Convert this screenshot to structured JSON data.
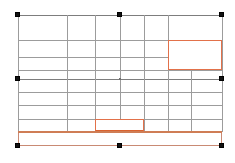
{
  "document": {
    "title": "Table object selection",
    "canvas_background": "#ffffff"
  },
  "selection": {
    "label": "Selected table frame",
    "handle_name": "selection-handle",
    "bounds": {
      "x": 18,
      "y": 15,
      "width": 204,
      "height": 131
    },
    "handles": [
      {
        "name": "handle-top-left",
        "x": 18,
        "y": 15
      },
      {
        "name": "handle-top-center",
        "x": 120,
        "y": 15
      },
      {
        "name": "handle-top-right",
        "x": 222,
        "y": 15
      },
      {
        "name": "handle-middle-left",
        "x": 18,
        "y": 79
      },
      {
        "name": "handle-middle-right",
        "x": 222,
        "y": 79
      },
      {
        "name": "handle-bottom-left",
        "x": 18,
        "y": 146
      },
      {
        "name": "handle-bottom-center",
        "x": 120,
        "y": 146
      },
      {
        "name": "handle-bottom-right",
        "x": 222,
        "y": 146
      }
    ],
    "center_marker": {
      "name": "rotation-center-dot",
      "x": 120,
      "y": 79
    }
  },
  "grid": {
    "accent_color": "#e2714a",
    "line_color": "#9c9c9c",
    "columns_x": [
      0,
      49,
      77,
      102,
      126,
      150,
      204
    ],
    "rows_y": [
      0,
      25,
      42,
      55,
      64,
      77,
      90,
      104,
      117,
      131
    ],
    "horizontal_lines": [
      {
        "name": "grid-row-line-1",
        "y": 0,
        "weight": "strong"
      },
      {
        "name": "grid-row-line-2",
        "y": 25,
        "weight": "normal"
      },
      {
        "name": "grid-row-line-3",
        "y": 42,
        "weight": "normal"
      },
      {
        "name": "grid-row-line-4",
        "y": 55,
        "weight": "normal"
      },
      {
        "name": "grid-row-line-5",
        "y": 64,
        "weight": "strong"
      },
      {
        "name": "grid-row-line-6",
        "y": 77,
        "weight": "normal"
      },
      {
        "name": "grid-row-line-7",
        "y": 90,
        "weight": "normal"
      },
      {
        "name": "grid-row-line-8",
        "y": 104,
        "weight": "normal"
      }
    ],
    "vertical_lines": [
      {
        "name": "grid-col-line-1",
        "x": 0,
        "top": 0,
        "height": 117
      },
      {
        "name": "grid-col-line-2",
        "x": 49,
        "top": 0,
        "height": 117
      },
      {
        "name": "grid-col-line-3",
        "x": 77,
        "top": 0,
        "height": 117
      },
      {
        "name": "grid-col-line-4",
        "x": 102,
        "top": 0,
        "height": 117
      },
      {
        "name": "grid-col-line-5",
        "x": 126,
        "top": 0,
        "height": 117
      },
      {
        "name": "grid-col-line-6",
        "x": 150,
        "top": 0,
        "height": 117
      },
      {
        "name": "grid-col-line-7",
        "x": 173,
        "top": 55,
        "height": 62
      },
      {
        "name": "grid-col-line-8",
        "x": 204,
        "top": 0,
        "height": 117
      }
    ]
  },
  "highlighted_cells": [
    {
      "name": "highlighted-cell-top-right",
      "x": 150,
      "y": 25,
      "width": 54,
      "height": 30,
      "color": "#e2714a"
    },
    {
      "name": "highlighted-cell-bottom-center",
      "x": 77,
      "y": 104,
      "width": 49,
      "height": 13,
      "color": "#e2714a"
    }
  ],
  "footer_band": {
    "name": "highlighted-footer-row",
    "x": 0,
    "y": 117,
    "width": 204,
    "height": 14,
    "border_color": "#c98a74",
    "accent_color": "#cf7d55"
  }
}
